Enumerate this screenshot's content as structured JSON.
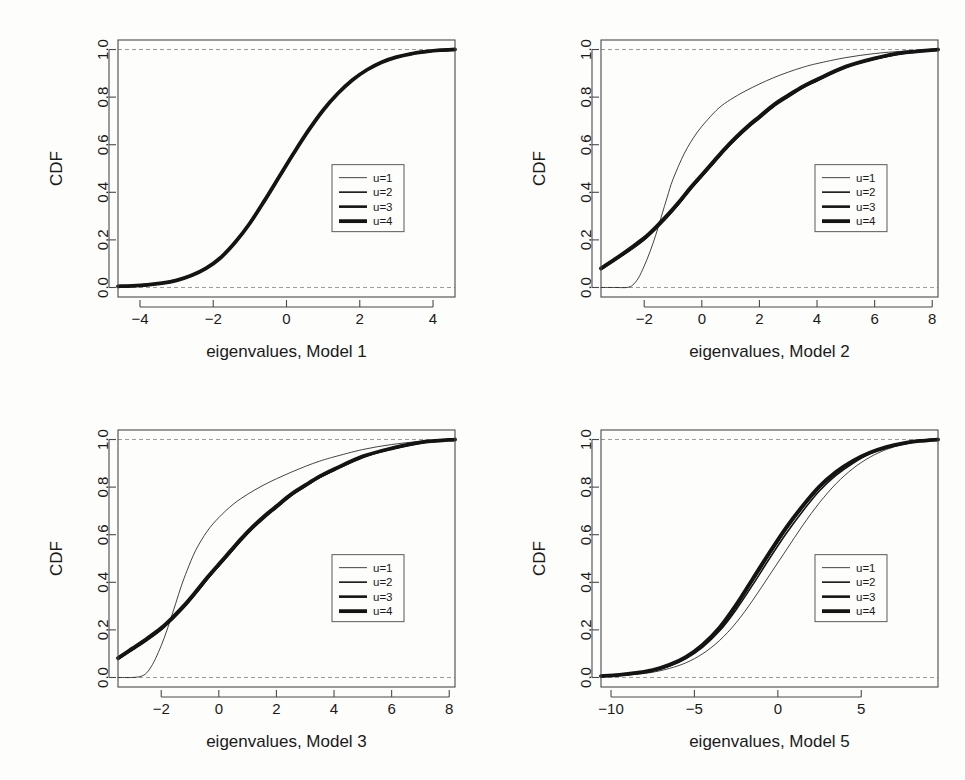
{
  "figure": {
    "background_color": "#fdfdfc",
    "ink_color": "#141414",
    "reference_line_color": "#9a9a9a",
    "panel_count": 4
  },
  "legend": {
    "entries": [
      {
        "label": "u=1",
        "line_width": 0.8
      },
      {
        "label": "u=2",
        "line_width": 1.6
      },
      {
        "label": "u=3",
        "line_width": 2.6
      },
      {
        "label": "u=4",
        "line_width": 3.8
      }
    ]
  },
  "chart_data": [
    {
      "type": "line",
      "panel": "top-left",
      "title": "",
      "xlabel": "eigenvalues, Model 1",
      "ylabel": "CDF",
      "xlim": [
        -4.6,
        4.6
      ],
      "ylim": [
        -0.04,
        1.04
      ],
      "xticks": [
        -4,
        -2,
        0,
        2,
        4
      ],
      "xticklabels": [
        "-4",
        "-2",
        "0",
        "2",
        "4"
      ],
      "yticks": [
        0.0,
        0.2,
        0.4,
        0.6,
        0.8,
        1.0
      ],
      "yticklabels": [
        "0.0",
        "0.2",
        "0.4",
        "0.6",
        "0.8",
        "1.0"
      ],
      "grid": false,
      "reference_lines_y": [
        0.0,
        1.0
      ],
      "legend_position": "center-right",
      "series": [
        {
          "name": "u=1",
          "line_width": 0.8,
          "x": [
            -4.6,
            -4.2,
            -3.8,
            -3.4,
            -3.0,
            -2.6,
            -2.2,
            -1.8,
            -1.4,
            -1.0,
            -0.6,
            -0.2,
            0.2,
            0.6,
            1.0,
            1.4,
            1.8,
            2.2,
            2.6,
            3.0,
            3.4,
            3.8,
            4.2,
            4.6
          ],
          "y": [
            0.005,
            0.007,
            0.011,
            0.018,
            0.03,
            0.05,
            0.08,
            0.125,
            0.19,
            0.27,
            0.365,
            0.465,
            0.565,
            0.66,
            0.745,
            0.815,
            0.872,
            0.915,
            0.947,
            0.968,
            0.982,
            0.991,
            0.997,
            1.0
          ]
        },
        {
          "name": "u=2",
          "line_width": 1.6,
          "x": [
            -4.6,
            -4.2,
            -3.8,
            -3.4,
            -3.0,
            -2.6,
            -2.2,
            -1.8,
            -1.4,
            -1.0,
            -0.6,
            -0.2,
            0.2,
            0.6,
            1.0,
            1.4,
            1.8,
            2.2,
            2.6,
            3.0,
            3.4,
            3.8,
            4.2,
            4.6
          ],
          "y": [
            0.005,
            0.007,
            0.011,
            0.018,
            0.03,
            0.05,
            0.08,
            0.125,
            0.19,
            0.27,
            0.365,
            0.465,
            0.565,
            0.66,
            0.745,
            0.815,
            0.872,
            0.915,
            0.947,
            0.968,
            0.982,
            0.991,
            0.997,
            1.0
          ]
        },
        {
          "name": "u=3",
          "line_width": 2.6,
          "x": [
            -4.6,
            -4.2,
            -3.8,
            -3.4,
            -3.0,
            -2.6,
            -2.2,
            -1.8,
            -1.4,
            -1.0,
            -0.6,
            -0.2,
            0.2,
            0.6,
            1.0,
            1.4,
            1.8,
            2.2,
            2.6,
            3.0,
            3.4,
            3.8,
            4.2,
            4.6
          ],
          "y": [
            0.005,
            0.007,
            0.011,
            0.018,
            0.03,
            0.05,
            0.08,
            0.125,
            0.19,
            0.27,
            0.365,
            0.465,
            0.565,
            0.66,
            0.745,
            0.815,
            0.872,
            0.915,
            0.947,
            0.968,
            0.982,
            0.991,
            0.997,
            1.0
          ]
        },
        {
          "name": "u=4",
          "line_width": 3.8,
          "x": [
            -4.6,
            -4.2,
            -3.8,
            -3.4,
            -3.0,
            -2.6,
            -2.2,
            -1.8,
            -1.4,
            -1.0,
            -0.6,
            -0.2,
            0.2,
            0.6,
            1.0,
            1.4,
            1.8,
            2.2,
            2.6,
            3.0,
            3.4,
            3.8,
            4.2,
            4.6
          ],
          "y": [
            0.005,
            0.007,
            0.011,
            0.018,
            0.03,
            0.05,
            0.08,
            0.125,
            0.19,
            0.27,
            0.365,
            0.465,
            0.565,
            0.66,
            0.745,
            0.815,
            0.872,
            0.915,
            0.947,
            0.968,
            0.982,
            0.991,
            0.997,
            1.0
          ]
        }
      ]
    },
    {
      "type": "line",
      "panel": "top-right",
      "title": "",
      "xlabel": "eigenvalues, Model 2",
      "ylabel": "CDF",
      "xlim": [
        -3.5,
        8.2
      ],
      "ylim": [
        -0.04,
        1.04
      ],
      "xticks": [
        -2,
        0,
        2,
        4,
        6,
        8
      ],
      "xticklabels": [
        "-2",
        "0",
        "2",
        "4",
        "6",
        "8"
      ],
      "yticks": [
        0.0,
        0.2,
        0.4,
        0.6,
        0.8,
        1.0
      ],
      "yticklabels": [
        "0.0",
        "0.2",
        "0.4",
        "0.6",
        "0.8",
        "1.0"
      ],
      "grid": false,
      "reference_lines_y": [
        0.0,
        1.0
      ],
      "legend_position": "center-right",
      "series": [
        {
          "name": "u=1",
          "line_width": 0.8,
          "x": [
            -3.5,
            -3.0,
            -2.6,
            -2.4,
            -2.2,
            -2.0,
            -1.8,
            -1.6,
            -1.4,
            -1.2,
            -1.0,
            -0.6,
            -0.2,
            0.2,
            0.6,
            1.0,
            1.5,
            2.0,
            2.5,
            3.0,
            3.5,
            4.0,
            5.0,
            6.0,
            7.0,
            8.2
          ],
          "y": [
            0.0,
            0.0,
            0.0,
            0.01,
            0.04,
            0.09,
            0.15,
            0.22,
            0.3,
            0.38,
            0.455,
            0.565,
            0.645,
            0.705,
            0.755,
            0.79,
            0.825,
            0.855,
            0.882,
            0.905,
            0.925,
            0.941,
            0.966,
            0.983,
            0.993,
            1.0
          ]
        },
        {
          "name": "u=2",
          "line_width": 1.6,
          "x": [
            -3.5,
            -3.0,
            -2.5,
            -2.0,
            -1.6,
            -1.2,
            -0.8,
            -0.4,
            0.0,
            0.4,
            0.8,
            1.2,
            1.6,
            2.0,
            2.5,
            3.0,
            3.5,
            4.0,
            5.0,
            6.0,
            7.0,
            8.2
          ],
          "y": [
            0.075,
            0.115,
            0.155,
            0.2,
            0.245,
            0.295,
            0.35,
            0.41,
            0.465,
            0.52,
            0.575,
            0.625,
            0.67,
            0.71,
            0.76,
            0.8,
            0.838,
            0.868,
            0.925,
            0.96,
            0.985,
            1.0
          ]
        },
        {
          "name": "u=3",
          "line_width": 2.6,
          "x": [
            -3.5,
            -3.0,
            -2.5,
            -2.0,
            -1.6,
            -1.2,
            -0.8,
            -0.4,
            0.0,
            0.4,
            0.8,
            1.2,
            1.6,
            2.0,
            2.5,
            3.0,
            3.5,
            4.0,
            5.0,
            6.0,
            7.0,
            8.2
          ],
          "y": [
            0.08,
            0.12,
            0.16,
            0.205,
            0.25,
            0.3,
            0.355,
            0.415,
            0.47,
            0.525,
            0.58,
            0.63,
            0.675,
            0.715,
            0.765,
            0.805,
            0.842,
            0.872,
            0.927,
            0.962,
            0.986,
            1.0
          ]
        },
        {
          "name": "u=4",
          "line_width": 3.8,
          "x": [
            -3.5,
            -3.0,
            -2.5,
            -2.0,
            -1.6,
            -1.2,
            -0.8,
            -0.4,
            0.0,
            0.4,
            0.8,
            1.2,
            1.6,
            2.0,
            2.5,
            3.0,
            3.5,
            4.0,
            5.0,
            6.0,
            7.0,
            8.2
          ],
          "y": [
            0.08,
            0.12,
            0.163,
            0.208,
            0.253,
            0.303,
            0.358,
            0.418,
            0.473,
            0.528,
            0.583,
            0.633,
            0.678,
            0.718,
            0.768,
            0.807,
            0.844,
            0.874,
            0.928,
            0.963,
            0.987,
            1.0
          ]
        }
      ]
    },
    {
      "type": "line",
      "panel": "bottom-left",
      "title": "",
      "xlabel": "eigenvalues, Model 3",
      "ylabel": "CDF",
      "xlim": [
        -3.5,
        8.2
      ],
      "ylim": [
        -0.04,
        1.04
      ],
      "xticks": [
        -2,
        0,
        2,
        4,
        6,
        8
      ],
      "xticklabels": [
        "-2",
        "0",
        "2",
        "4",
        "6",
        "8"
      ],
      "yticks": [
        0.0,
        0.2,
        0.4,
        0.6,
        0.8,
        1.0
      ],
      "yticklabels": [
        "0.0",
        "0.2",
        "0.4",
        "0.6",
        "0.8",
        "1.0"
      ],
      "grid": false,
      "reference_lines_y": [
        0.0,
        1.0
      ],
      "legend_position": "center-right",
      "series": [
        {
          "name": "u=1",
          "line_width": 0.8,
          "x": [
            -3.5,
            -3.0,
            -2.7,
            -2.5,
            -2.3,
            -2.1,
            -1.9,
            -1.7,
            -1.5,
            -1.3,
            -1.1,
            -0.8,
            -0.4,
            0.0,
            0.5,
            1.0,
            1.5,
            2.0,
            2.5,
            3.0,
            3.5,
            4.0,
            5.0,
            6.0,
            7.0,
            8.2
          ],
          "y": [
            0.0,
            0.0,
            0.005,
            0.02,
            0.055,
            0.105,
            0.165,
            0.235,
            0.31,
            0.385,
            0.45,
            0.535,
            0.615,
            0.672,
            0.728,
            0.77,
            0.805,
            0.835,
            0.862,
            0.887,
            0.909,
            0.927,
            0.958,
            0.979,
            0.992,
            1.0
          ]
        },
        {
          "name": "u=2",
          "line_width": 1.6,
          "x": [
            -3.5,
            -3.0,
            -2.5,
            -2.0,
            -1.6,
            -1.2,
            -0.8,
            -0.4,
            0.0,
            0.4,
            0.8,
            1.2,
            1.6,
            2.0,
            2.5,
            3.0,
            3.5,
            4.0,
            5.0,
            6.0,
            7.0,
            8.2
          ],
          "y": [
            0.075,
            0.115,
            0.155,
            0.2,
            0.245,
            0.295,
            0.352,
            0.412,
            0.468,
            0.523,
            0.578,
            0.628,
            0.672,
            0.712,
            0.762,
            0.802,
            0.84,
            0.87,
            0.926,
            0.961,
            0.986,
            1.0
          ]
        },
        {
          "name": "u=3",
          "line_width": 2.6,
          "x": [
            -3.5,
            -3.0,
            -2.5,
            -2.0,
            -1.6,
            -1.2,
            -0.8,
            -0.4,
            0.0,
            0.4,
            0.8,
            1.2,
            1.6,
            2.0,
            2.5,
            3.0,
            3.5,
            4.0,
            5.0,
            6.0,
            7.0,
            8.2
          ],
          "y": [
            0.08,
            0.12,
            0.16,
            0.205,
            0.25,
            0.3,
            0.357,
            0.417,
            0.473,
            0.528,
            0.583,
            0.633,
            0.677,
            0.717,
            0.767,
            0.806,
            0.843,
            0.873,
            0.928,
            0.962,
            0.987,
            1.0
          ]
        },
        {
          "name": "u=4",
          "line_width": 3.8,
          "x": [
            -3.5,
            -3.0,
            -2.5,
            -2.0,
            -1.6,
            -1.2,
            -0.8,
            -0.4,
            0.0,
            0.4,
            0.8,
            1.2,
            1.6,
            2.0,
            2.5,
            3.0,
            3.5,
            4.0,
            5.0,
            6.0,
            7.0,
            8.2
          ],
          "y": [
            0.082,
            0.122,
            0.163,
            0.208,
            0.253,
            0.303,
            0.36,
            0.42,
            0.476,
            0.531,
            0.586,
            0.636,
            0.68,
            0.72,
            0.769,
            0.808,
            0.845,
            0.875,
            0.929,
            0.963,
            0.988,
            1.0
          ]
        }
      ]
    },
    {
      "type": "line",
      "panel": "bottom-right",
      "title": "",
      "xlabel": "eigenvalues, Model 5",
      "ylabel": "CDF",
      "xlim": [
        -10.6,
        9.6
      ],
      "ylim": [
        -0.04,
        1.04
      ],
      "xticks": [
        -10,
        -5,
        0,
        5
      ],
      "xticklabels": [
        "-10",
        "-5",
        "0",
        "5"
      ],
      "yticks": [
        0.0,
        0.2,
        0.4,
        0.6,
        0.8,
        1.0
      ],
      "yticklabels": [
        "0.0",
        "0.2",
        "0.4",
        "0.6",
        "0.8",
        "1.0"
      ],
      "grid": false,
      "reference_lines_y": [
        0.0,
        1.0
      ],
      "legend_position": "center-right",
      "series": [
        {
          "name": "u=1",
          "line_width": 0.8,
          "x": [
            -10.6,
            -9.5,
            -8.5,
            -7.5,
            -6.5,
            -5.5,
            -4.5,
            -3.5,
            -2.5,
            -1.5,
            -0.5,
            0.5,
            1.5,
            2.5,
            3.5,
            4.5,
            5.5,
            6.5,
            7.5,
            8.5,
            9.6
          ],
          "y": [
            0.005,
            0.008,
            0.013,
            0.022,
            0.038,
            0.062,
            0.1,
            0.155,
            0.23,
            0.325,
            0.43,
            0.535,
            0.64,
            0.735,
            0.815,
            0.878,
            0.925,
            0.958,
            0.979,
            0.992,
            1.0
          ]
        },
        {
          "name": "u=2",
          "line_width": 1.6,
          "x": [
            -10.6,
            -9.5,
            -8.5,
            -7.5,
            -6.5,
            -5.5,
            -4.5,
            -3.5,
            -2.5,
            -1.5,
            -0.5,
            0.5,
            1.5,
            2.5,
            3.5,
            4.5,
            5.5,
            6.5,
            7.5,
            8.5,
            9.6
          ],
          "y": [
            0.006,
            0.01,
            0.017,
            0.028,
            0.048,
            0.08,
            0.128,
            0.195,
            0.285,
            0.39,
            0.5,
            0.605,
            0.7,
            0.785,
            0.85,
            0.9,
            0.94,
            0.965,
            0.982,
            0.993,
            1.0
          ]
        },
        {
          "name": "u=3",
          "line_width": 2.6,
          "x": [
            -10.6,
            -9.5,
            -8.5,
            -7.5,
            -6.5,
            -5.5,
            -4.5,
            -3.5,
            -2.5,
            -1.5,
            -0.5,
            0.5,
            1.5,
            2.5,
            3.5,
            4.5,
            5.5,
            6.5,
            7.5,
            8.5,
            9.6
          ],
          "y": [
            0.006,
            0.011,
            0.018,
            0.03,
            0.052,
            0.085,
            0.135,
            0.205,
            0.3,
            0.41,
            0.52,
            0.625,
            0.718,
            0.8,
            0.862,
            0.908,
            0.943,
            0.967,
            0.983,
            0.994,
            1.0
          ]
        },
        {
          "name": "u=4",
          "line_width": 3.8,
          "x": [
            -10.6,
            -9.5,
            -8.5,
            -7.5,
            -6.5,
            -5.5,
            -4.5,
            -3.5,
            -2.5,
            -1.5,
            -0.5,
            0.5,
            1.5,
            2.5,
            3.5,
            4.5,
            5.5,
            6.5,
            7.5,
            8.5,
            9.6
          ],
          "y": [
            0.006,
            0.011,
            0.019,
            0.031,
            0.053,
            0.087,
            0.138,
            0.209,
            0.305,
            0.415,
            0.525,
            0.63,
            0.722,
            0.803,
            0.864,
            0.91,
            0.944,
            0.968,
            0.984,
            0.994,
            1.0
          ]
        }
      ]
    }
  ]
}
